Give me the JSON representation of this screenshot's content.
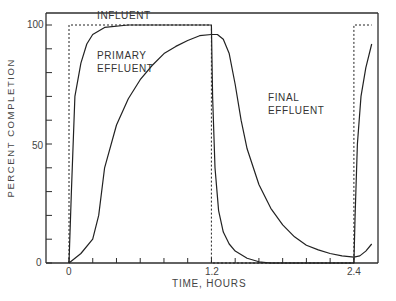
{
  "chart_data": {
    "type": "line",
    "title": "",
    "xlabel": "TIME, HOURS",
    "ylabel": "PERCENT COMPLETION",
    "xlim": [
      -0.2,
      2.55
    ],
    "ylim": [
      0,
      105
    ],
    "x_ticks": [
      0,
      1.2,
      2.4
    ],
    "x_tick_labels": [
      "0",
      "1.2",
      "2.4"
    ],
    "x_minor_tick_step": 0.2,
    "y_ticks": [
      0,
      50,
      100
    ],
    "y_tick_labels": [
      "0",
      "50",
      "100"
    ],
    "y_minor_tick_step": 10,
    "grid": false,
    "legend": "inline labels",
    "series": [
      {
        "name": "INFLUENT",
        "style": "dashed",
        "x": [
          0,
          0,
          1.2,
          1.2,
          2.4,
          2.4,
          2.55
        ],
        "y": [
          0,
          100,
          100,
          0,
          0,
          100,
          100
        ]
      },
      {
        "name": "PRIMARY EFFLUENT",
        "style": "solid",
        "x": [
          0,
          0.02,
          0.05,
          0.1,
          0.15,
          0.2,
          0.3,
          0.5,
          0.8,
          1.2,
          1.21,
          1.23,
          1.26,
          1.3,
          1.35,
          1.4,
          1.5,
          1.6,
          1.7,
          2.4,
          2.41,
          2.43,
          2.46,
          2.5,
          2.55
        ],
        "y": [
          0,
          30,
          70,
          84,
          92,
          96,
          99,
          100,
          100,
          100,
          70,
          40,
          22,
          13,
          8,
          5,
          2,
          0.5,
          0,
          0,
          20,
          50,
          70,
          82,
          92
        ]
      },
      {
        "name": "FINAL EFFLUENT",
        "style": "solid",
        "x": [
          0,
          0.1,
          0.2,
          0.25,
          0.3,
          0.4,
          0.5,
          0.6,
          0.7,
          0.8,
          0.9,
          1.0,
          1.1,
          1.2,
          1.25,
          1.3,
          1.35,
          1.4,
          1.45,
          1.5,
          1.6,
          1.7,
          1.8,
          1.9,
          2.0,
          2.1,
          2.2,
          2.3,
          2.4,
          2.45,
          2.5,
          2.55
        ],
        "y": [
          0,
          4,
          10,
          20,
          40,
          58,
          69,
          77,
          83,
          88,
          91,
          93.5,
          95.5,
          96,
          96,
          94,
          88,
          75,
          60,
          48,
          33,
          23,
          16,
          11,
          7.5,
          5.5,
          4,
          3,
          2.5,
          3,
          5,
          8
        ]
      }
    ],
    "annotations": [
      {
        "text": "INFLUENT",
        "x": 0.5,
        "y": 102
      },
      {
        "text": "PRIMARY",
        "x": 0.55,
        "y": 80
      },
      {
        "text": "EFFLUENT",
        "x": 0.55,
        "y": 73
      },
      {
        "text": "FINAL",
        "x": 1.58,
        "y": 56
      },
      {
        "text": "EFFLUENT",
        "x": 1.58,
        "y": 49
      }
    ]
  },
  "labels": {
    "influent": "INFLUENT",
    "primary_1": "PRIMARY",
    "primary_2": "EFFLUENT",
    "final_1": "FINAL",
    "final_2": "EFFLUENT",
    "xlabel": "TIME, HOURS",
    "ylabel": "PERCENT COMPLETION",
    "x0": "0",
    "x12": "1.2",
    "x24": "2.4",
    "y0": "0",
    "y50": "50",
    "y100": "100"
  }
}
